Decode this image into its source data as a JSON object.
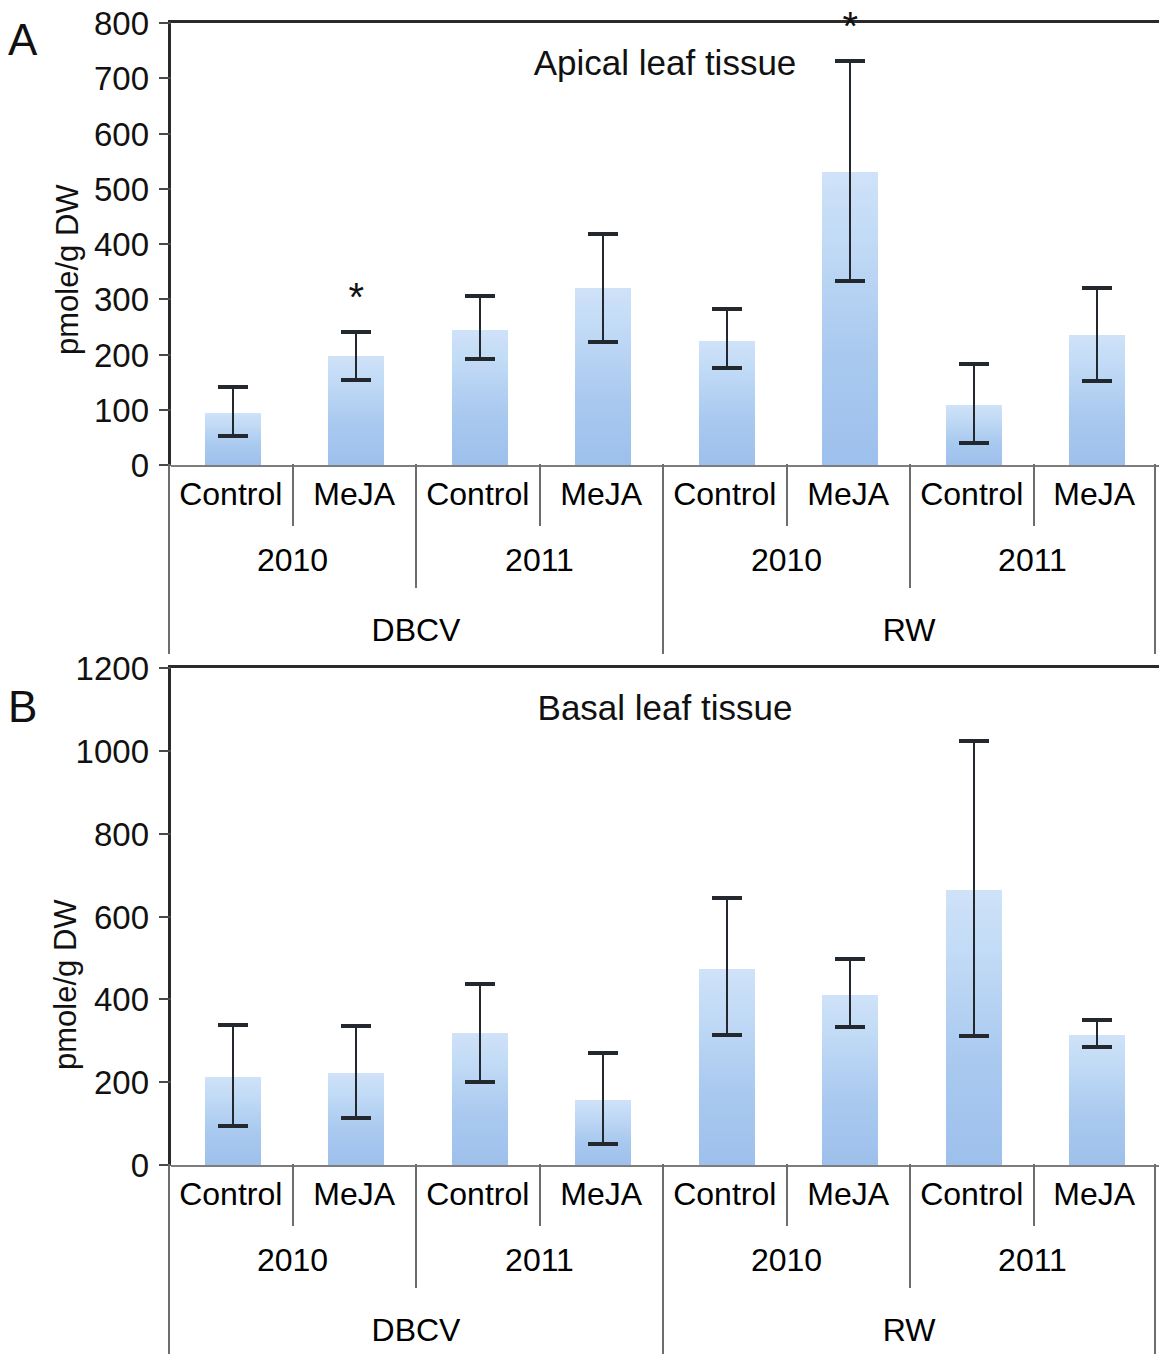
{
  "figure": {
    "panels": [
      {
        "letter": "A",
        "title": "Apical leaf tissue",
        "ylabel": "pmole/g DW",
        "yticks": [
          "0",
          "100",
          "200",
          "300",
          "400",
          "500",
          "600",
          "700",
          "800"
        ]
      },
      {
        "letter": "B",
        "title": "Basal leaf tissue",
        "ylabel": "pmole/g DW",
        "yticks": [
          "0",
          "200",
          "400",
          "600",
          "800",
          "1000",
          "1200"
        ]
      }
    ],
    "axis_tiers": {
      "treatments": [
        "Control",
        "MeJA",
        "Control",
        "MeJA",
        "Control",
        "MeJA",
        "Control",
        "MeJA"
      ],
      "years": [
        "2010",
        "2011",
        "2010",
        "2011"
      ],
      "cultivars": [
        "DBCV",
        "RW"
      ]
    },
    "significance_marker": "*",
    "colors": {
      "bar_top": "#cfe2f8",
      "bar_bottom": "#9dc0ec",
      "error_bar": "#23272e",
      "axis": "#2a2a2a",
      "text": "#111111"
    }
  },
  "chart_data": [
    {
      "type": "bar",
      "panel": "A",
      "title": "Apical leaf tissue",
      "xlabel": "",
      "ylabel": "pmole/g DW",
      "ylim": [
        0,
        800
      ],
      "ytick_step": 100,
      "grid": false,
      "legend": "none",
      "categories": [
        "DBCV 2010 Control",
        "DBCV 2010 MeJA",
        "DBCV 2011 Control",
        "DBCV 2011 MeJA",
        "RW 2010 Control",
        "RW 2010 MeJA",
        "RW 2011 Control",
        "RW 2011 MeJA"
      ],
      "values": [
        95,
        198,
        245,
        320,
        225,
        530,
        108,
        235
      ],
      "error_low": [
        50,
        152,
        190,
        220,
        173,
        332,
        38,
        150
      ],
      "error_high": [
        143,
        242,
        307,
        420,
        285,
        733,
        185,
        323
      ],
      "significance": [
        false,
        true,
        false,
        false,
        false,
        true,
        false,
        false
      ]
    },
    {
      "type": "bar",
      "panel": "B",
      "title": "Basal leaf tissue",
      "xlabel": "",
      "ylabel": "pmole/g DW",
      "ylim": [
        0,
        1200
      ],
      "ytick_step": 200,
      "grid": false,
      "legend": "none",
      "categories": [
        "DBCV 2010 Control",
        "DBCV 2010 MeJA",
        "DBCV 2011 Control",
        "DBCV 2011 MeJA",
        "RW 2010 Control",
        "RW 2010 MeJA",
        "RW 2011 Control",
        "RW 2011 MeJA"
      ],
      "values": [
        213,
        222,
        318,
        158,
        473,
        410,
        663,
        315
      ],
      "error_low": [
        92,
        110,
        198,
        48,
        312,
        330,
        310,
        283
      ],
      "error_high": [
        340,
        338,
        440,
        272,
        648,
        500,
        1025,
        352
      ],
      "significance": [
        false,
        false,
        false,
        false,
        false,
        false,
        false,
        false
      ]
    }
  ]
}
